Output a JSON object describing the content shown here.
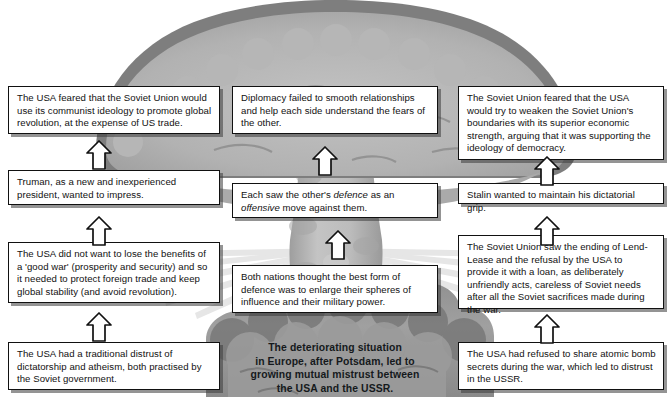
{
  "diagram": {
    "title_caption": {
      "lines": [
        "The deteriorating situation",
        "in Europe, after Potsdam, led to",
        "growing mutual mistrust between",
        "the USA and the USSR."
      ]
    },
    "artwork": {
      "name": "mushroom-cloud-illustration",
      "cap_color": "#b3b3b3",
      "cap_rim_color": "#7d7d7d",
      "stem_color": "#bdbdbd",
      "base_color": "#9a9a9a",
      "base_dark_color": "#6f6f6f",
      "ray_color": "#d8d8d8"
    },
    "boxes": [
      {
        "id": "usa-feared-communist-ideology",
        "text": "The USA feared that the Soviet Union would use its communist ideology to promote global revolution, at the expense of US trade."
      },
      {
        "id": "diplomacy-failed",
        "text": "Diplomacy failed to smooth relationships and help each side understand the fears of the other."
      },
      {
        "id": "soviet-feared-usa-economic-strength",
        "text": "The Soviet Union feared that the USA would try to weaken the Soviet Union's boundaries with its superior economic strength, arguing that it was supporting the ideology of democracy."
      },
      {
        "id": "truman-inexperienced",
        "text": "Truman, as a new and inexperienced president, wanted to impress."
      },
      {
        "id": "defence-as-offensive",
        "text_parts": [
          {
            "text": "Each saw the other's ",
            "italic": false
          },
          {
            "text": "defence",
            "italic": true
          },
          {
            "text": " as an ",
            "italic": false
          },
          {
            "text": "offensive",
            "italic": true
          },
          {
            "text": " move against them.",
            "italic": false
          }
        ],
        "text": "Each saw the other's defence as an offensive move against them."
      },
      {
        "id": "stalin-dictatorial-grip",
        "text": "Stalin wanted to maintain his dictatorial grip."
      },
      {
        "id": "usa-benefits-good-war",
        "text": "The USA did not want to lose the benefits of a 'good war' (prosperity and security) and so it needed to protect foreign trade and keep global stability (and avoid revolution)."
      },
      {
        "id": "spheres-of-influence",
        "text": "Both nations thought the best form of defence was to enlarge their spheres of influence and their military power."
      },
      {
        "id": "lend-lease-ending",
        "text": "The Soviet Union saw the ending of Lend-Lease and the refusal by the USA to provide it with a loan, as deliberately unfriendly acts, careless of Soviet needs after all the Soviet sacrifices made during the war."
      },
      {
        "id": "usa-distrust-dictatorship",
        "text": "The USA had a traditional distrust of dictatorship and atheism, both practised by the Soviet government."
      },
      {
        "id": "atomic-bomb-secrets",
        "text": "The USA had refused to share atomic bomb secrets during the war, which led to distrust in the USSR."
      }
    ],
    "arrows": [
      {
        "id": "arrow-left-upper",
        "name": "up-arrow-truman-to-usa-feared"
      },
      {
        "id": "arrow-center-upper",
        "name": "up-arrow-defence-to-diplomacy"
      },
      {
        "id": "arrow-right-upper",
        "name": "up-arrow-stalin-to-soviet-feared"
      },
      {
        "id": "arrow-left-middle",
        "name": "up-arrow-good-war-to-truman"
      },
      {
        "id": "arrow-center-middle",
        "name": "up-arrow-spheres-to-defence"
      },
      {
        "id": "arrow-right-middle",
        "name": "up-arrow-lend-lease-to-stalin"
      },
      {
        "id": "arrow-left-lower",
        "name": "up-arrow-distrust-to-good-war"
      },
      {
        "id": "arrow-right-lower",
        "name": "up-arrow-atomic-to-lend-lease"
      }
    ]
  }
}
